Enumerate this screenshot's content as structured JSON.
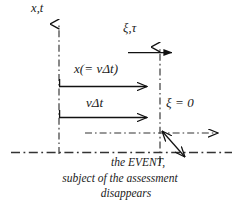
{
  "figure": {
    "background_color": "#ffffff",
    "ink_color": "#1a1a1a"
  },
  "axes": {
    "rest_frame": {
      "label": "x,t",
      "icon": "up-arrow-axis-icon",
      "line_style": "dash-dot"
    },
    "moving_frame": {
      "label": "ξ,τ",
      "icon": "up-arrow-axis-icon",
      "line_style": "dash-dot"
    }
  },
  "arrows": {
    "top_right": {
      "name": "moving-frame-horizontal-arrow",
      "head": "solid"
    },
    "displacement_upper": {
      "label": "x(= vΔt)",
      "head": "open"
    },
    "displacement_lower": {
      "label": "vΔt",
      "head": "open"
    },
    "rest_frame_axis_arrow": {
      "name": "rest-frame-horizontal-arrow",
      "head": "open"
    },
    "pointer": {
      "name": "event-pointer-arrow",
      "head": "double-open"
    }
  },
  "annotations": {
    "xi_zero": "ξ = 0"
  },
  "caption": {
    "line1": "the EVENT,",
    "line2": "subject of the assessment",
    "line3": "disappears"
  }
}
